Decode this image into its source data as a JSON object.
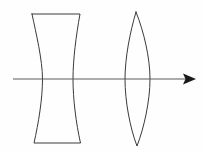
{
  "figure": {
    "title": "Optical diagram: diverging and converging lens on a common optical axis",
    "type": "line-drawing",
    "width": 204,
    "height": 152,
    "background_color": "#fefefe",
    "stroke_color": "#3a3a3a",
    "axis_color": "#5a5a5a",
    "arrow_color": "#1a1a1a"
  },
  "elements": {
    "concave_lens": {
      "name": "biconcave-diverging-lens",
      "label": "Biconcave lens",
      "top_left_x": 32,
      "top_right_x": 80,
      "top_y": 14,
      "bottom_left_x": 34,
      "bottom_right_x": 80,
      "bottom_y": 143,
      "waist_left_x": 43,
      "waist_right_x": 73,
      "waist_y": 79
    },
    "convex_lens": {
      "name": "biconvex-converging-lens",
      "label": "Biconvex lens",
      "apex_top_x": 136,
      "apex_top_y": 12,
      "apex_bottom_x": 137,
      "apex_bottom_y": 146,
      "widest_left_x": 125,
      "widest_right_x": 150,
      "widest_y": 79
    },
    "optical_axis": {
      "name": "optical-axis",
      "label": "Optical axis",
      "start_x": 13,
      "end_x": 196,
      "y": 79,
      "has_arrowhead": true,
      "arrow_direction": "right"
    }
  },
  "annotations": {
    "caption": "",
    "axis_label": "",
    "lens_left_label": "",
    "lens_right_label": ""
  }
}
